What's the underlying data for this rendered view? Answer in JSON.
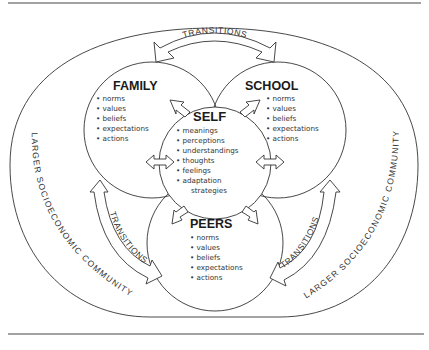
{
  "diagram": {
    "outer_context": {
      "label_left": "LARGER SOCIOECONOMIC COMMUNITY",
      "label_right": "LARGER SOCIOECONOMIC COMMUNITY"
    },
    "worlds": {
      "family": {
        "title": "FAMILY",
        "items": [
          "norms",
          "values",
          "beliefs",
          "expectations",
          "actions"
        ]
      },
      "school": {
        "title": "SCHOOL",
        "items": [
          "norms",
          "values",
          "beliefs",
          "expectations",
          "actions"
        ]
      },
      "peers": {
        "title": "PEERS",
        "items": [
          "norms",
          "values",
          "beliefs",
          "expectations",
          "actions"
        ]
      },
      "self": {
        "title": "SELF",
        "items": [
          "meanings",
          "perceptions",
          "understandings",
          "thoughts",
          "feelings",
          "adaptation",
          "strategies"
        ]
      }
    },
    "transitions": {
      "top": "TRANSITIONS",
      "left": "TRANSITIONS",
      "right": "TRANSITIONS"
    },
    "bullet": "•"
  }
}
